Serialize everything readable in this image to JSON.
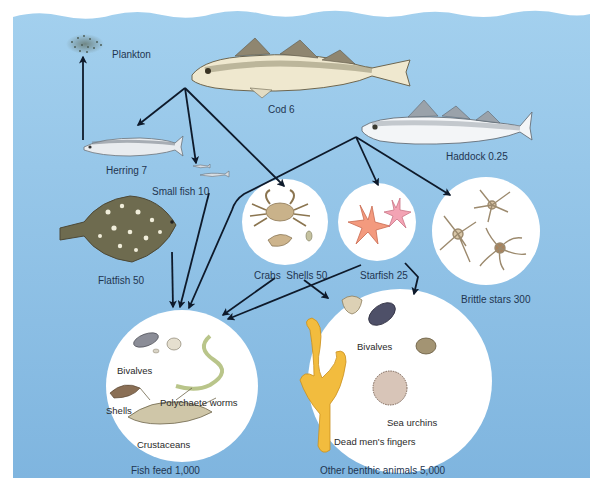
{
  "diagram": {
    "type": "marine food web",
    "colors": {
      "water_top": "#a3d0ee",
      "water_bottom": "#7fb5df",
      "arrow": "#0e1a2b",
      "label_text": "#1f3550",
      "circle_fill": "#ffffff",
      "background": "#ffffff"
    },
    "nodes": {
      "plankton": {
        "label": "Plankton"
      },
      "cod": {
        "label": "Cod 6"
      },
      "herring": {
        "label": "Herring 7"
      },
      "haddock": {
        "label": "Haddock 0.25"
      },
      "small_fish": {
        "label": "Small fish 10"
      },
      "flatfish": {
        "label": "Flatfish 50"
      },
      "crabs_shells": {
        "label": "Crabs  Shells 50"
      },
      "starfish": {
        "label": "Starfish 25"
      },
      "brittle_stars": {
        "label": "Brittle stars 300"
      },
      "fish_feed": {
        "label": "Fish feed 1,000",
        "contents": [
          "Bivalves",
          "Shells",
          "Polychaete worms",
          "Crustaceans"
        ]
      },
      "other_benthic": {
        "label": "Other benthic animals 5,000",
        "contents": [
          "Bivalves",
          "Sea urchins",
          "Dead men's fingers"
        ]
      }
    },
    "edges": [
      {
        "from": "herring",
        "to": "plankton"
      },
      {
        "from": "cod",
        "to": "herring"
      },
      {
        "from": "cod",
        "to": "small_fish"
      },
      {
        "from": "cod",
        "to": "crabs_shells"
      },
      {
        "from": "haddock",
        "to": "starfish"
      },
      {
        "from": "haddock",
        "to": "brittle_stars"
      },
      {
        "from": "haddock",
        "to": "fish_feed"
      },
      {
        "from": "small_fish",
        "to": "fish_feed"
      },
      {
        "from": "flatfish",
        "to": "fish_feed"
      },
      {
        "from": "crabs_shells",
        "to": "fish_feed"
      },
      {
        "from": "crabs_shells",
        "to": "other_benthic"
      },
      {
        "from": "starfish",
        "to": "fish_feed"
      },
      {
        "from": "starfish",
        "to": "other_benthic"
      }
    ]
  }
}
